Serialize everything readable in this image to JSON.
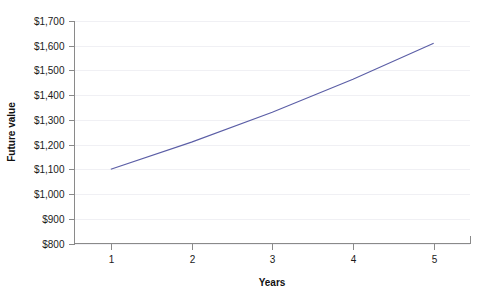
{
  "chart_data": {
    "type": "line",
    "title": "",
    "subtitle": "",
    "xlabel": "Years",
    "ylabel": "Future value",
    "x": [
      1,
      2,
      3,
      4,
      5
    ],
    "series": [
      {
        "name": "Future value",
        "values": [
          1100,
          1210,
          1331,
          1464,
          1610
        ],
        "color": "#5b5ea6"
      }
    ],
    "x_tick_labels": [
      "1",
      "2",
      "3",
      "4",
      "5"
    ],
    "y_tick_values": [
      800,
      900,
      1000,
      1100,
      1200,
      1300,
      1400,
      1500,
      1600,
      1700
    ],
    "y_tick_labels": [
      "$800",
      "$900",
      "$1,000",
      "$1,100",
      "$1,200",
      "$1,300",
      "$1,400",
      "$1,500",
      "$1,600",
      "$1,700"
    ],
    "xlim": [
      0.55,
      5.45
    ],
    "ylim": [
      800,
      1700
    ],
    "grid": true,
    "grid_axis": "y",
    "legend": false,
    "legend_position": "none",
    "background_color": "#ffffff",
    "axis_color": "#8a8a8a",
    "text_color": "#1a1a1a",
    "grid_color": "#f0f0f4"
  }
}
